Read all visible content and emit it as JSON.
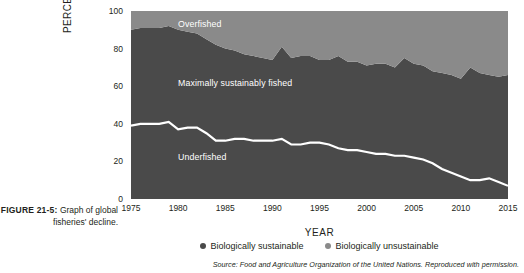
{
  "figure": {
    "label": "FIGURE 21-5:",
    "caption": "Graph of global fisheries' decline."
  },
  "legend": {
    "items": [
      {
        "label": "Biologically sustainable",
        "color": "#4a4a4a",
        "dot": "legend-dot-sustainable"
      },
      {
        "label": "Biologically unsustainable",
        "color": "#8a8a8a",
        "dot": "legend-dot-unsustainable"
      }
    ]
  },
  "source": "Source: Food and Agriculture Organization of the United Nations. Reproduced with permission.",
  "colors": {
    "underfished": "#4a4a4a",
    "maximally_sustainably_fished": "#4a4a4a",
    "overfished": "#8a8a8a",
    "divider_line": "#ffffff",
    "axis": "#231f20",
    "background": "#ffffff"
  },
  "chart_data": {
    "type": "area",
    "title": "",
    "xlabel": "YEAR",
    "ylabel": "PERCENTAGE",
    "xlim": [
      1975,
      2015
    ],
    "ylim": [
      0,
      100
    ],
    "xticks": [
      1975,
      1980,
      1985,
      1990,
      1995,
      2000,
      2005,
      2010,
      2015
    ],
    "yticks": [
      0,
      20,
      40,
      60,
      80,
      100
    ],
    "grid": false,
    "legend_position": "bottom-center",
    "stacked": true,
    "annotations": [
      {
        "text": "Overfished",
        "x": 1978,
        "y": 95
      },
      {
        "text": "Maximally sustainably fished",
        "x": 1978,
        "y": 64
      },
      {
        "text": "Underfished",
        "x": 1978,
        "y": 24
      }
    ],
    "x": [
      1975,
      1976,
      1977,
      1978,
      1979,
      1980,
      1981,
      1982,
      1983,
      1984,
      1985,
      1986,
      1987,
      1988,
      1989,
      1990,
      1991,
      1992,
      1993,
      1994,
      1995,
      1996,
      1997,
      1998,
      1999,
      2000,
      2001,
      2002,
      2003,
      2004,
      2005,
      2006,
      2007,
      2008,
      2009,
      2010,
      2011,
      2012,
      2013,
      2014,
      2015
    ],
    "series": [
      {
        "name": "Underfished",
        "stack_band": "bottom",
        "values": [
          39,
          40,
          40,
          40,
          41,
          37,
          38,
          38,
          35,
          31,
          31,
          32,
          32,
          31,
          31,
          31,
          32,
          29,
          29,
          30,
          30,
          29,
          27,
          26,
          26,
          25,
          24,
          24,
          23,
          23,
          22,
          21,
          19,
          16,
          14,
          12,
          10,
          10,
          11,
          9,
          7
        ]
      },
      {
        "name": "Maximally sustainably fished",
        "stack_band": "middle",
        "values": [
          51,
          51,
          51,
          51,
          51,
          53,
          51,
          50,
          50,
          51,
          49,
          47,
          45,
          45,
          44,
          43,
          49,
          46,
          47,
          46,
          44,
          45,
          49,
          47,
          47,
          46,
          48,
          48,
          47,
          52,
          50,
          50,
          49,
          51,
          52,
          52,
          60,
          57,
          55,
          56,
          59
        ]
      },
      {
        "name": "Overfished",
        "stack_band": "top",
        "values": [
          10,
          9,
          9,
          9,
          8,
          10,
          11,
          12,
          15,
          18,
          20,
          21,
          23,
          24,
          25,
          26,
          19,
          25,
          24,
          24,
          26,
          26,
          24,
          27,
          27,
          29,
          28,
          28,
          30,
          25,
          28,
          29,
          32,
          33,
          34,
          36,
          30,
          33,
          34,
          35,
          34
        ]
      }
    ],
    "boundaries": {
      "underfished_top": [
        39,
        40,
        40,
        40,
        41,
        37,
        38,
        38,
        35,
        31,
        31,
        32,
        32,
        31,
        31,
        31,
        32,
        29,
        29,
        30,
        30,
        29,
        27,
        26,
        26,
        25,
        24,
        24,
        23,
        23,
        22,
        21,
        19,
        16,
        14,
        12,
        10,
        10,
        11,
        9,
        7
      ],
      "sustainable_top": [
        90,
        91,
        91,
        91,
        92,
        90,
        89,
        88,
        85,
        82,
        80,
        79,
        77,
        76,
        75,
        74,
        81,
        75,
        76,
        76,
        74,
        74,
        76,
        73,
        73,
        71,
        72,
        72,
        70,
        75,
        72,
        71,
        68,
        67,
        66,
        64,
        70,
        67,
        66,
        65,
        66
      ]
    }
  }
}
